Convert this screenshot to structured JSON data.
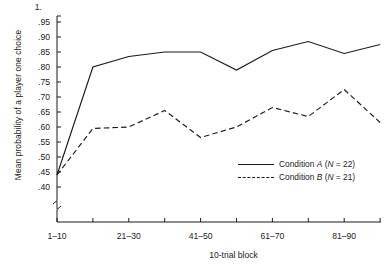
{
  "chart_data": {
    "type": "line",
    "title": "",
    "xlabel": "10-trial block",
    "ylabel": "Mean probability of a player one choice",
    "categories": [
      "1-10",
      "11-20",
      "21-30",
      "31-40",
      "41-50",
      "51-60",
      "61-70",
      "71-80",
      "81-90",
      "91-100"
    ],
    "x_tick_labels": [
      "1–10",
      "",
      "21–30",
      "",
      "41–50",
      "",
      "61–70",
      "",
      "81–90",
      ""
    ],
    "y_tick_labels": [
      "1.",
      ".95",
      ".90",
      ".85",
      ".80",
      ".75",
      ".70",
      ".65",
      ".60",
      ".55",
      ".50",
      ".45",
      ".40"
    ],
    "y_tick_values": [
      1.0,
      0.95,
      0.9,
      0.85,
      0.8,
      0.75,
      0.7,
      0.65,
      0.6,
      0.55,
      0.5,
      0.45,
      0.4
    ],
    "ylim": [
      0.4,
      1.0
    ],
    "y_axis_break": true,
    "grid": false,
    "legend_position": "inside-lower-right",
    "series": [
      {
        "name": "Condition A",
        "legend_label": "Condition A  (N = 22)",
        "n": 22,
        "style": "solid",
        "values": [
          0.44,
          0.8,
          0.835,
          0.85,
          0.85,
          0.79,
          0.855,
          0.885,
          0.845,
          0.875
        ]
      },
      {
        "name": "Condition B",
        "legend_label": "Condition B  (N = 21)",
        "n": 21,
        "style": "dashed",
        "values": [
          0.44,
          0.595,
          0.6,
          0.655,
          0.565,
          0.6,
          0.665,
          0.635,
          0.725,
          0.615
        ]
      }
    ]
  },
  "legend": {
    "rows": [
      {
        "prefix": "Condition ",
        "series": "A",
        "paren": " (",
        "nsym": "N",
        "eq": " = ",
        "nval": "22",
        "close": ")"
      },
      {
        "prefix": "Condition ",
        "series": "B",
        "paren": " (",
        "nsym": "N",
        "eq": " = ",
        "nval": "21",
        "close": ")"
      }
    ]
  },
  "axes": {
    "y_title": "Mean probability of a player one choice",
    "x_title": "10-trial block"
  },
  "colors": {
    "ink": "#1b1b1b",
    "background": "#ffffff"
  }
}
